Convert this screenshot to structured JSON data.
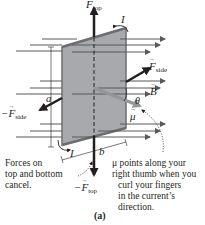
{
  "figure": {
    "caption": "(a)",
    "colors": {
      "plate_fill": "#a7a9ac",
      "plate_edge": "#6d6e71",
      "field_lines": "#58595b",
      "force_arrows": "#231f20",
      "mu_arrow": "#939598",
      "text": "#231f20"
    },
    "labels": {
      "f_top": {
        "symbol": "F",
        "sub": "top"
      },
      "neg_f_top": {
        "prefix": "−",
        "symbol": "F",
        "sub": "top"
      },
      "f_side": {
        "symbol": "F",
        "sub": "side"
      },
      "neg_f_side": {
        "prefix": "−",
        "symbol": "F",
        "sub": "side"
      },
      "b_field": "B",
      "mu": "μ",
      "theta": "θ",
      "current_top": "I",
      "current_bottom": "I",
      "dim_a": "a",
      "dim_b": "b"
    },
    "annotations": {
      "left_note": [
        "Forces on",
        "top and bottom",
        "cancel."
      ],
      "right_note": [
        "μ points along your",
        "right thumb when you",
        "curl your fingers",
        "in the current’s",
        "direction."
      ]
    }
  }
}
